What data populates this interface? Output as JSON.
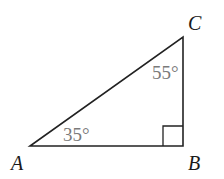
{
  "diagram": {
    "type": "right-triangle",
    "vertices": {
      "A": {
        "label": "A",
        "x": 30,
        "y": 146
      },
      "B": {
        "label": "B",
        "x": 183,
        "y": 146
      },
      "C": {
        "label": "C",
        "x": 183,
        "y": 37
      }
    },
    "angles": {
      "A": "35°",
      "C": "55°",
      "B": "right angle"
    },
    "colors": {
      "lines": "#222222",
      "angle_text": "#7a7a7a",
      "vertex_text": "#1a1a1a"
    }
  }
}
